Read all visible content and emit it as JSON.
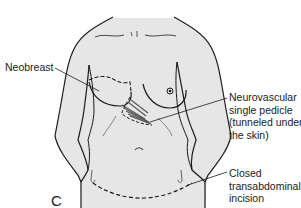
{
  "figure": {
    "panel_letter": "C",
    "colors": {
      "skin": "#e6e6e6",
      "outline": "#1a1a1a",
      "pedicle": "#555555",
      "background": "#ffffff"
    }
  },
  "labels": {
    "neobreast": "Neobreast",
    "pedicle": [
      "Neurovascular",
      "single pedicle",
      "(tunneled under",
      "the skin)"
    ],
    "incision": [
      "Closed",
      "transabdominal",
      "incision"
    ]
  }
}
